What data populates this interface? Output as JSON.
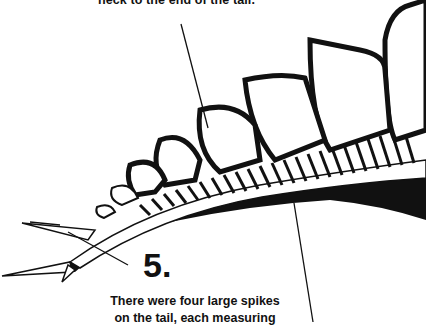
{
  "illustration": {
    "subject": "stegosaurus-tail-skeleton",
    "top_caption": "neck to the end of the tail.",
    "callout_number": "5.",
    "bottom_caption_lines": [
      "There were four large spikes",
      "on the tail, each measuring"
    ],
    "colors": {
      "ink": "#111111",
      "paper": "#ffffff"
    }
  }
}
